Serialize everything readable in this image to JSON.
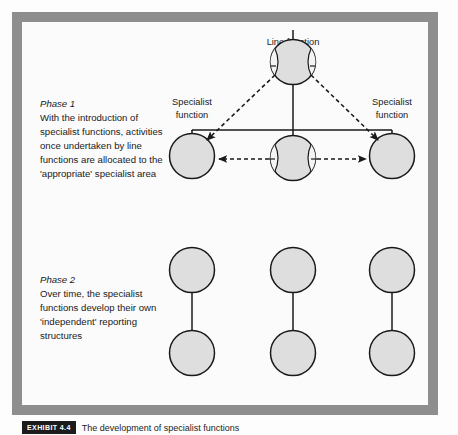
{
  "figure": {
    "caption_badge": "EXHIBIT 4.4",
    "caption_text": "The development of specialist functions"
  },
  "colors": {
    "frame": "#8e8e8e",
    "panel": "#fbfbfb",
    "node_fill": "#dedede",
    "stroke": "#1a1a1a",
    "crescent_fill": "#f4f4f4"
  },
  "phase1": {
    "title": "Phase 1",
    "body_lines": [
      "With the introduction of",
      "specialist functions, activities",
      "once undertaken by line",
      "functions are allocated to the",
      "'appropriate' specialist area"
    ],
    "labels": {
      "line_function": "Line function",
      "specialist_left_line1": "Specialist",
      "specialist_left_line2": "function",
      "specialist_right_line1": "Specialist",
      "specialist_right_line2": "function"
    }
  },
  "phase2": {
    "title": "Phase 2",
    "body_lines": [
      "Over time, the specialist",
      "functions develop their own",
      "'independent' reporting",
      "structures"
    ]
  },
  "diagram_data": {
    "type": "diagram",
    "phase1_nodes": [
      {
        "id": "line-function-top",
        "cx": 293,
        "cy": 62,
        "r": 23,
        "kind": "line-function",
        "label": "Line function"
      },
      {
        "id": "specialist-left",
        "cx": 192,
        "cy": 153,
        "r": 23,
        "kind": "specialist",
        "label": "Specialist function"
      },
      {
        "id": "line-function-bottom",
        "cx": 293,
        "cy": 158,
        "r": 23,
        "kind": "line-function",
        "label": ""
      },
      {
        "id": "specialist-right",
        "cx": 392,
        "cy": 153,
        "r": 23,
        "kind": "specialist",
        "label": "Specialist function"
      }
    ],
    "phase1_edges": [
      {
        "from": "line-function-top",
        "to": "specialist-left",
        "style": "dashed",
        "arrow": true
      },
      {
        "from": "line-function-top",
        "to": "specialist-right",
        "style": "dashed",
        "arrow": true
      },
      {
        "from": "line-function-bottom",
        "to": "specialist-left",
        "style": "dashed",
        "arrow": true
      },
      {
        "from": "line-function-bottom",
        "to": "specialist-right",
        "style": "dashed",
        "arrow": true
      },
      {
        "from": "line-function-top",
        "to": "bus",
        "style": "solid",
        "arrow": false
      },
      {
        "from": "bus",
        "to": "specialist-left",
        "style": "solid",
        "arrow": false
      },
      {
        "from": "bus",
        "to": "specialist-right",
        "style": "solid",
        "arrow": false
      },
      {
        "from": "bus",
        "to": "line-function-bottom",
        "style": "solid",
        "arrow": false
      }
    ],
    "phase2_columns": [
      {
        "cx": 192,
        "top_cy": 292,
        "bottom_cy": 375,
        "r": 23
      },
      {
        "cx": 293,
        "top_cy": 292,
        "bottom_cy": 375,
        "r": 23
      },
      {
        "cx": 392,
        "top_cy": 292,
        "bottom_cy": 375,
        "r": 23
      }
    ],
    "phase2_edges": [
      {
        "style": "solid",
        "arrow": "up-out-of-top-circle"
      },
      {
        "style": "solid",
        "arrow": "none",
        "note": "vertical link between top and bottom circle"
      }
    ]
  }
}
